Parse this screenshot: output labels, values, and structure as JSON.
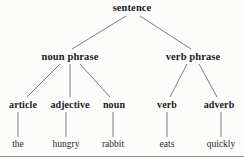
{
  "diagram": {
    "background_color": "#fcfcfb",
    "edge_color": "#6e6e6e",
    "text_color": "#1b1b1b",
    "rule_color": "#8a8a8a"
  },
  "nodes": {
    "root": {
      "label": "sentence",
      "x": 132,
      "y": 8
    },
    "level1": [
      {
        "label": "noun phrase",
        "x": 70,
        "y": 57
      },
      {
        "label": "verb phrase",
        "x": 193,
        "y": 57
      }
    ],
    "level2": [
      {
        "label": "article",
        "x": 23,
        "y": 105
      },
      {
        "label": "adjective",
        "x": 70,
        "y": 105
      },
      {
        "label": "noun",
        "x": 114,
        "y": 105
      },
      {
        "label": "verb",
        "x": 167,
        "y": 105
      },
      {
        "label": "adverb",
        "x": 219,
        "y": 105
      }
    ],
    "leaves": [
      {
        "label": "the",
        "x": 18,
        "y": 145
      },
      {
        "label": "hungry",
        "x": 66,
        "y": 145
      },
      {
        "label": "rabbit",
        "x": 113,
        "y": 145
      },
      {
        "label": "eats",
        "x": 167,
        "y": 145
      },
      {
        "label": "quickly",
        "x": 221,
        "y": 145
      }
    ]
  },
  "edges": [
    {
      "name": "sentence-to-noun-phrase",
      "x1": 126,
      "y1": 16,
      "x2": 72,
      "y2": 49
    },
    {
      "name": "sentence-to-verb-phrase",
      "x1": 140,
      "y1": 16,
      "x2": 191,
      "y2": 49
    },
    {
      "name": "noun-phrase-to-article",
      "x1": 60,
      "y1": 64,
      "x2": 27,
      "y2": 97
    },
    {
      "name": "noun-phrase-to-adjective",
      "x1": 70,
      "y1": 64,
      "x2": 70,
      "y2": 97
    },
    {
      "name": "noun-phrase-to-noun",
      "x1": 80,
      "y1": 64,
      "x2": 110,
      "y2": 97
    },
    {
      "name": "verb-phrase-to-verb",
      "x1": 187,
      "y1": 64,
      "x2": 170,
      "y2": 97
    },
    {
      "name": "verb-phrase-to-adverb",
      "x1": 199,
      "y1": 64,
      "x2": 217,
      "y2": 97
    },
    {
      "name": "article-to-the",
      "x1": 18,
      "y1": 112,
      "x2": 18,
      "y2": 137
    },
    {
      "name": "adjective-to-hungry",
      "x1": 66,
      "y1": 112,
      "x2": 66,
      "y2": 137
    },
    {
      "name": "noun-to-rabbit",
      "x1": 113,
      "y1": 112,
      "x2": 113,
      "y2": 137
    },
    {
      "name": "verb-to-eats",
      "x1": 167,
      "y1": 112,
      "x2": 167,
      "y2": 137
    },
    {
      "name": "adverb-to-quickly",
      "x1": 221,
      "y1": 112,
      "x2": 221,
      "y2": 137
    }
  ]
}
